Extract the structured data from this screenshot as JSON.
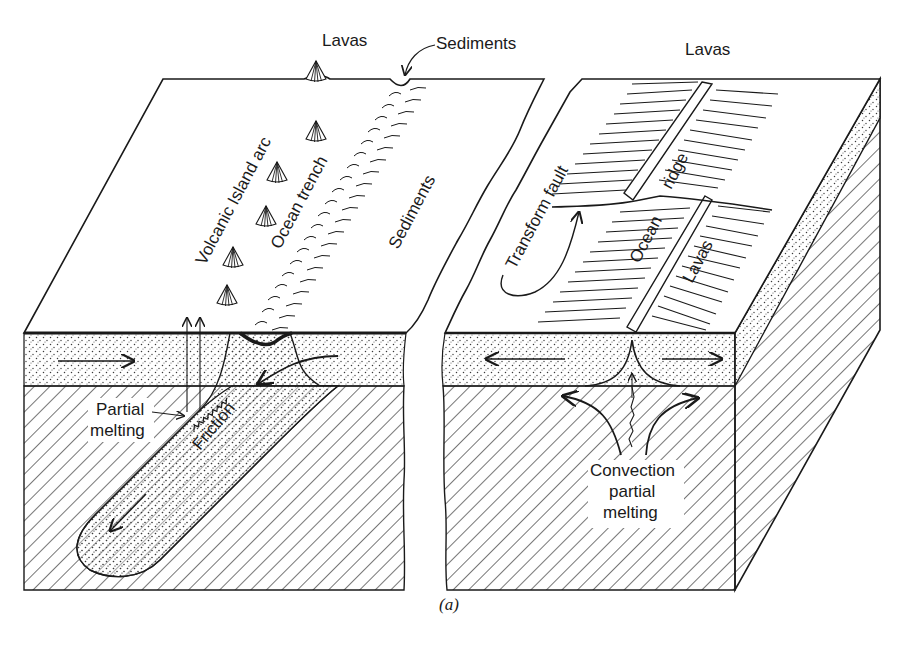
{
  "figure": {
    "domain": "plate-tectonics block diagram",
    "caption": "(a)",
    "colors": {
      "ink": "#1a1a1a",
      "paper": "#ffffff",
      "stipple": "#3a3a3a"
    }
  },
  "left_block": {
    "title_region": "subduction zone",
    "labels": {
      "lavas_top": "Lavas",
      "sediments_top": "Sediments",
      "volcanic_arc": "Volcanic Island arc",
      "ocean_trench": "Ocean trench",
      "sediments_side": "Sediments",
      "partial_melting_line1": "Partial",
      "partial_melting_line2": "melting",
      "friction": "Friction"
    },
    "volcano_count": 6
  },
  "right_block": {
    "title_region": "spreading ridge",
    "labels": {
      "lavas_top": "Lavas",
      "transform_fault": "Transform fault",
      "ocean_ridge_1": "Ocean",
      "ocean_ridge_2": "ridge",
      "lavas_side": "Lavas",
      "convection_line1": "Convection",
      "convection_line2": "partial",
      "convection_line3": "melting"
    }
  },
  "icons": {
    "volcano": "volcano-cone-icon",
    "flow_arrow": "arrow-icon"
  }
}
